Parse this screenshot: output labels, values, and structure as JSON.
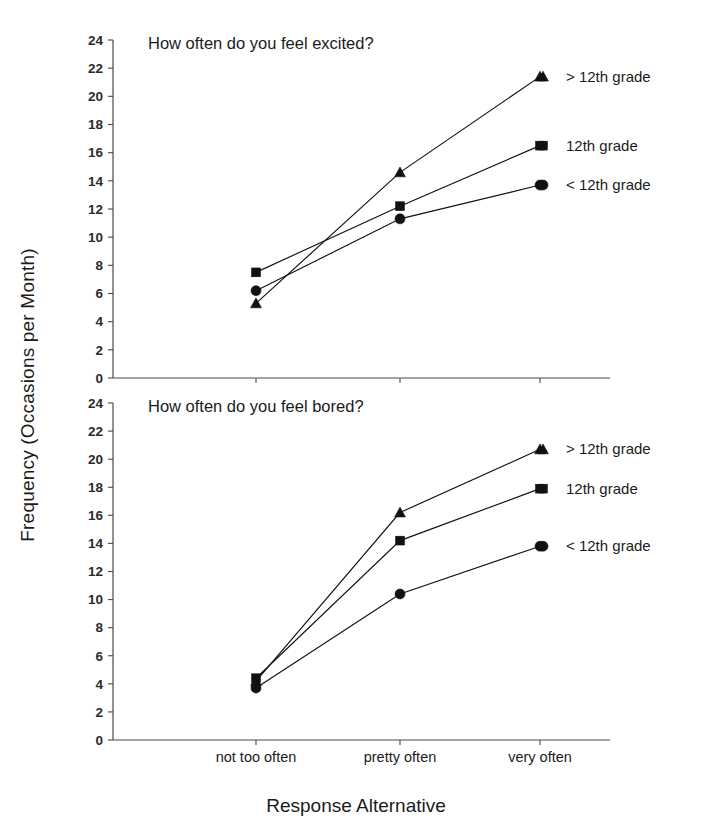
{
  "chart_data": [
    {
      "type": "line",
      "title": "How often do you feel excited?",
      "panel": "top",
      "xlabel": "Response Alternative",
      "ylabel": "Frequency (Occasions per Month)",
      "categories": [
        "not too often",
        "pretty often",
        "very often"
      ],
      "ylim": [
        0,
        24
      ],
      "ytick_step": 2,
      "yticks": [
        0,
        2,
        4,
        6,
        8,
        10,
        12,
        14,
        16,
        18,
        20,
        22,
        24
      ],
      "grid": false,
      "legend_position": "right-inside",
      "series": [
        {
          "name": "> 12th grade",
          "marker": "triangle",
          "values": [
            5.3,
            14.6,
            21.4
          ]
        },
        {
          "name": "12th grade",
          "marker": "square",
          "values": [
            7.5,
            12.2,
            16.5
          ]
        },
        {
          "name": "< 12th grade",
          "marker": "circle",
          "values": [
            6.2,
            11.3,
            13.7
          ]
        }
      ]
    },
    {
      "type": "line",
      "title": "How often do you feel bored?",
      "panel": "bottom",
      "xlabel": "Response Alternative",
      "ylabel": "Frequency (Occasions per Month)",
      "categories": [
        "not too often",
        "pretty often",
        "very often"
      ],
      "ylim": [
        0,
        24
      ],
      "ytick_step": 2,
      "yticks": [
        0,
        2,
        4,
        6,
        8,
        10,
        12,
        14,
        16,
        18,
        20,
        22,
        24
      ],
      "grid": false,
      "legend_position": "right-inside",
      "series": [
        {
          "name": "> 12th grade",
          "marker": "triangle",
          "values": [
            4.2,
            16.2,
            20.7
          ]
        },
        {
          "name": "12th grade",
          "marker": "square",
          "values": [
            4.4,
            14.2,
            17.9
          ]
        },
        {
          "name": "< 12th grade",
          "marker": "circle",
          "values": [
            3.7,
            10.4,
            13.8
          ]
        }
      ]
    }
  ],
  "figure": {
    "ylabel": "Frequency (Occasions per Month)",
    "xlabel": "Response Alternative",
    "colors": {
      "ink": "#111111",
      "axis": "#4a4a4a",
      "background": "#ffffff"
    }
  }
}
